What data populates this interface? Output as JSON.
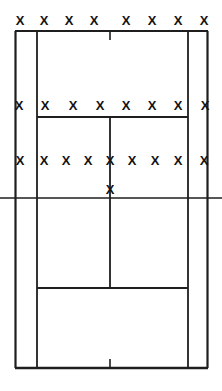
{
  "figure": {
    "name": "court-diagram-with-shot-markers",
    "width": 222,
    "height": 391,
    "background_color": "#ffffff",
    "line_color": "#1e1e1e",
    "marker_color": "#131313",
    "marker_glyph": "X"
  },
  "court": {
    "lines": [
      {
        "name": "left-outer-sideline",
        "type": "vertical",
        "x": 15.5,
        "y1": 31,
        "y2": 368,
        "width": 2.2
      },
      {
        "name": "left-inner-sideline",
        "type": "vertical",
        "x": 37,
        "y1": 31,
        "y2": 368,
        "width": 1.8
      },
      {
        "name": "right-inner-sideline",
        "type": "vertical",
        "x": 188,
        "y1": 31,
        "y2": 368,
        "width": 1.8
      },
      {
        "name": "right-outer-sideline",
        "type": "vertical",
        "x": 207.5,
        "y1": 31,
        "y2": 368,
        "width": 2.2
      },
      {
        "name": "top-baseline",
        "type": "horizontal",
        "y": 31,
        "x1": 15,
        "x2": 208,
        "width": 2.2
      },
      {
        "name": "top-centre-tick",
        "type": "vertical",
        "x": 110,
        "y1": 31,
        "y2": 40,
        "width": 1.6
      },
      {
        "name": "top-service-line",
        "type": "horizontal",
        "y": 117,
        "x1": 37,
        "x2": 188,
        "width": 1.8
      },
      {
        "name": "upper-centre-line",
        "type": "vertical",
        "x": 110,
        "y1": 117,
        "y2": 198,
        "width": 1.8
      },
      {
        "name": "net-centre-line",
        "type": "horizontal",
        "y": 198,
        "x1": 0,
        "x2": 222,
        "width": 1.6
      },
      {
        "name": "lower-centre-line",
        "type": "vertical",
        "x": 110,
        "y1": 198,
        "y2": 288,
        "width": 1.8
      },
      {
        "name": "bottom-service-line",
        "type": "horizontal",
        "y": 288,
        "x1": 37,
        "x2": 188,
        "width": 1.8
      },
      {
        "name": "bottom-baseline",
        "type": "horizontal",
        "y": 368,
        "x1": 15,
        "x2": 208,
        "width": 2.4
      },
      {
        "name": "bottom-centre-tick",
        "type": "vertical",
        "x": 110,
        "y1": 359,
        "y2": 368,
        "width": 1.6
      }
    ]
  },
  "markers": {
    "glyph": "X",
    "total_count": 26,
    "rows": [
      {
        "name": "baseline-marker-row",
        "y": 22,
        "count": 8,
        "points": [
          {
            "x": 20,
            "y": 22
          },
          {
            "x": 44,
            "y": 22
          },
          {
            "x": 69,
            "y": 22
          },
          {
            "x": 94,
            "y": 22
          },
          {
            "x": 126,
            "y": 22
          },
          {
            "x": 152,
            "y": 22
          },
          {
            "x": 178,
            "y": 22
          },
          {
            "x": 204,
            "y": 22
          }
        ]
      },
      {
        "name": "service-line-marker-row",
        "y": 107,
        "count": 8,
        "points": [
          {
            "x": 19,
            "y": 107
          },
          {
            "x": 45,
            "y": 107
          },
          {
            "x": 73,
            "y": 107
          },
          {
            "x": 100,
            "y": 107
          },
          {
            "x": 126,
            "y": 107
          },
          {
            "x": 152,
            "y": 107
          },
          {
            "x": 178,
            "y": 107
          },
          {
            "x": 205,
            "y": 107
          }
        ]
      },
      {
        "name": "mid-court-marker-row",
        "y": 162,
        "count": 9,
        "points": [
          {
            "x": 20,
            "y": 162
          },
          {
            "x": 44,
            "y": 162
          },
          {
            "x": 66,
            "y": 162
          },
          {
            "x": 88,
            "y": 162
          },
          {
            "x": 110,
            "y": 162
          },
          {
            "x": 132,
            "y": 162
          },
          {
            "x": 155,
            "y": 162
          },
          {
            "x": 178,
            "y": 162
          },
          {
            "x": 204,
            "y": 162
          }
        ]
      },
      {
        "name": "net-centre-marker-row",
        "y": 191,
        "count": 1,
        "points": [
          {
            "x": 110,
            "y": 191
          }
        ]
      }
    ]
  }
}
